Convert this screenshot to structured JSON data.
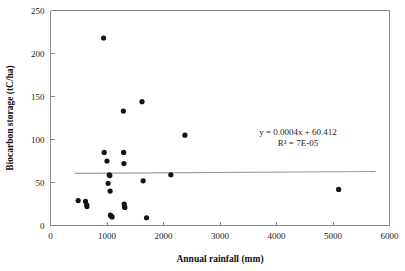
{
  "chart_data": {
    "type": "scatter",
    "title": "",
    "xlabel": "Annual rainfall (mm)",
    "ylabel": "Biocarbon storage (tC/ha)",
    "xlim": [
      0,
      6000
    ],
    "ylim": [
      0,
      250
    ],
    "xticks": [
      0,
      1000,
      2000,
      3000,
      4000,
      5000,
      6000
    ],
    "yticks": [
      0,
      50,
      100,
      150,
      200,
      250
    ],
    "xtick_labels": [
      "0",
      "1000",
      "2000",
      "3000",
      "4000",
      "5000",
      "6000"
    ],
    "ytick_labels": [
      "0",
      "50",
      "100",
      "150",
      "200",
      "250"
    ],
    "grid": false,
    "legend": null,
    "marker": "filled-circle",
    "marker_color": "#131313",
    "points": [
      {
        "x": 490,
        "y": 29
      },
      {
        "x": 620,
        "y": 28
      },
      {
        "x": 640,
        "y": 24
      },
      {
        "x": 645,
        "y": 22
      },
      {
        "x": 940,
        "y": 218
      },
      {
        "x": 950,
        "y": 85
      },
      {
        "x": 1000,
        "y": 75
      },
      {
        "x": 1020,
        "y": 49
      },
      {
        "x": 1040,
        "y": 59
      },
      {
        "x": 1050,
        "y": 58
      },
      {
        "x": 1055,
        "y": 40
      },
      {
        "x": 1060,
        "y": 12
      },
      {
        "x": 1075,
        "y": 11
      },
      {
        "x": 1090,
        "y": 10
      },
      {
        "x": 1290,
        "y": 133
      },
      {
        "x": 1295,
        "y": 85
      },
      {
        "x": 1300,
        "y": 72
      },
      {
        "x": 1305,
        "y": 25
      },
      {
        "x": 1310,
        "y": 22
      },
      {
        "x": 1315,
        "y": 21
      },
      {
        "x": 1620,
        "y": 144
      },
      {
        "x": 1640,
        "y": 52
      },
      {
        "x": 1700,
        "y": 9
      },
      {
        "x": 2130,
        "y": 59
      },
      {
        "x": 2380,
        "y": 105
      },
      {
        "x": 5100,
        "y": 42
      }
    ],
    "trendline": {
      "equation": "y = 0.0004x + 60.412",
      "r_squared_label": "R² = 7E-05",
      "slope": 0.0004,
      "intercept": 60.412,
      "x_start": 430,
      "x_end": 5750,
      "color": "#9a9a9a"
    },
    "annotations": [
      {
        "name": "regression-equation",
        "text": "y = 0.0004x + 60.412"
      },
      {
        "name": "r-squared",
        "text": "R² = 7E-05"
      }
    ]
  }
}
